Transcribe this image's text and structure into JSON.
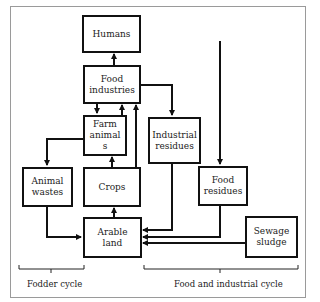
{
  "diagram": {
    "nodes": {
      "humans": "Humans",
      "food_industries": "Food\nindustries",
      "farm_animals": "Farm\nanimal\ns",
      "industrial_residues": "Industrial\nresidues",
      "animal_wastes": "Animal\nwastes",
      "crops": "Crops",
      "food_residues": "Food\nresidues",
      "arable_land": "Arable\nland",
      "sewage_sludge": "Sewage\nsludge"
    },
    "edges": [
      {
        "from": "food_industries",
        "to": "humans"
      },
      {
        "from": "food_industries",
        "to": "farm_animals"
      },
      {
        "from": "farm_animals",
        "to": "food_industries"
      },
      {
        "from": "crops",
        "to": "food_industries"
      },
      {
        "from": "food_industries",
        "to": "industrial_residues"
      },
      {
        "from": "farm_animals",
        "to": "animal_wastes"
      },
      {
        "from": "crops",
        "to": "farm_animals"
      },
      {
        "from": "arable_land",
        "to": "crops"
      },
      {
        "from": "animal_wastes",
        "to": "arable_land"
      },
      {
        "from": "industrial_residues",
        "to": "arable_land"
      },
      {
        "from": "food_residues",
        "to": "arable_land"
      },
      {
        "from": "sewage_sludge",
        "to": "arable_land"
      },
      {
        "from": "external",
        "to": "food_residues"
      }
    ],
    "groups": {
      "fodder_cycle": "Fodder cycle",
      "food_industrial_cycle": "Food and industrial cycle"
    },
    "colors": {
      "line": "#111111",
      "frame": "#9a9a9a"
    }
  }
}
